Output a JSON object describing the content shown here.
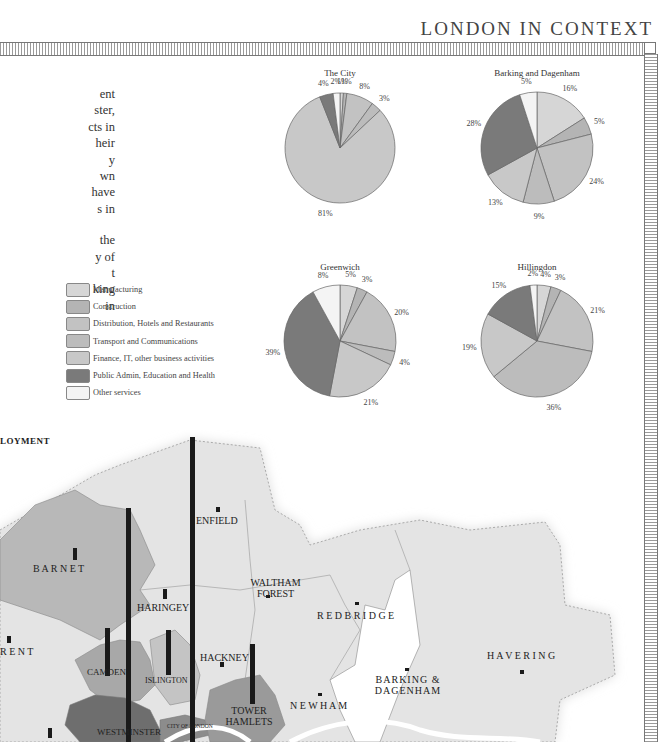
{
  "header": {
    "title": "LONDON IN CONTEXT"
  },
  "body_text": {
    "paragraph1": [
      "ent",
      "ster,",
      "cts in",
      "heir",
      "y",
      "wn",
      "have",
      "s in"
    ],
    "paragraph2": [
      "the",
      "y of",
      "t",
      "king",
      "in"
    ]
  },
  "legend": {
    "items": [
      {
        "label": "Manufacturing",
        "color": "#d6d6d6"
      },
      {
        "label": "Construction",
        "color": "#b4b4b4"
      },
      {
        "label": "Distribution, Hotels and Restaurants",
        "color": "#c2c2c2"
      },
      {
        "label": "Transport and Communications",
        "color": "#bcbcbc"
      },
      {
        "label": "Finance, IT, other business activities",
        "color": "#c8c8c8"
      },
      {
        "label": "Public Admin, Education and Health",
        "color": "#7a7a7a"
      },
      {
        "label": "Other services",
        "color": "#f4f4f4"
      }
    ]
  },
  "chart_data": [
    {
      "type": "pie",
      "title": "The City",
      "categories": [
        "Manufacturing",
        "Construction",
        "Distribution, Hotels and Restaurants",
        "Transport and Communications",
        "Finance, IT, other business activities",
        "Public Admin, Education and Health",
        "Other services"
      ],
      "values": [
        1,
        1,
        8,
        3,
        81,
        4,
        2
      ],
      "labels": [
        "1%",
        "1%",
        "8%",
        "3%",
        "81%",
        "4%",
        "2%"
      ]
    },
    {
      "type": "pie",
      "title": "Barking and Dagenham",
      "categories": [
        "Manufacturing",
        "Construction",
        "Distribution, Hotels and Restaurants",
        "Transport and Communications",
        "Finance, IT, other business activities",
        "Public Admin, Education and Health",
        "Other services"
      ],
      "values": [
        16,
        5,
        24,
        9,
        13,
        28,
        5
      ],
      "labels": [
        "16%",
        "5%",
        "24%",
        "9%",
        "13%",
        "28%",
        "5%"
      ]
    },
    {
      "type": "pie",
      "title": "Greenwich",
      "categories": [
        "Manufacturing",
        "Construction",
        "Distribution, Hotels and Restaurants",
        "Transport and Communications",
        "Finance, IT, other business activities",
        "Public Admin, Education and Health",
        "Other services"
      ],
      "values": [
        5,
        3,
        20,
        4,
        21,
        39,
        8
      ],
      "labels": [
        "5%",
        "3%",
        "20%",
        "4%",
        "21%",
        "39%",
        "8%"
      ]
    },
    {
      "type": "pie",
      "title": "Hillingdon",
      "categories": [
        "Manufacturing",
        "Construction",
        "Distribution, Hotels and Restaurants",
        "Transport and Communications",
        "Finance, IT, other business activities",
        "Public Admin, Education and Health",
        "Other services"
      ],
      "values": [
        4,
        3,
        21,
        36,
        19,
        15,
        2
      ],
      "labels": [
        "4%",
        "3%",
        "21%",
        "36%",
        "19%",
        "15%",
        "2%"
      ]
    }
  ],
  "map": {
    "heading": "LOYMENT",
    "boroughs": [
      {
        "name": "ENFIELD"
      },
      {
        "name": "B A R N E T"
      },
      {
        "name": "WALTHAM FOREST"
      },
      {
        "name": "HARINGEY"
      },
      {
        "name": "R E D B R I D G E"
      },
      {
        "name": "R E N T"
      },
      {
        "name": "CAMDEN"
      },
      {
        "name": "ISLINGTON"
      },
      {
        "name": "HACKNEY"
      },
      {
        "name": "H A V E R I N G"
      },
      {
        "name": "BARKING & DAGENHAM"
      },
      {
        "name": "TOWER HAMLETS"
      },
      {
        "name": "N E W H A M"
      },
      {
        "name": "WESTMINSTER"
      },
      {
        "name": "CITY OF LONDON"
      }
    ]
  }
}
